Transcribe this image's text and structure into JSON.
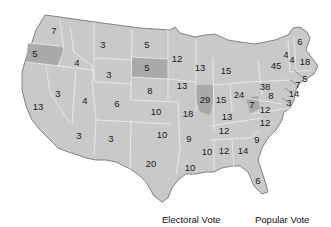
{
  "colors": {
    "land": "#c9c9c9",
    "land_dark": "#a9a9a9",
    "border": "#efefef",
    "coast": "#6a6a6a"
  },
  "legend": {
    "electoral_label": "Electoral Vote",
    "popular_label": "Popular Vote"
  },
  "states": [
    {
      "id": "WA",
      "votes": "7",
      "x": 54,
      "y": 31
    },
    {
      "id": "OR",
      "votes": "5",
      "x": 35,
      "y": 54,
      "dark": true
    },
    {
      "id": "CA",
      "votes": "13",
      "x": 38,
      "y": 107
    },
    {
      "id": "ID",
      "votes": "4",
      "x": 77,
      "y": 63
    },
    {
      "id": "NV",
      "votes": "3",
      "x": 58,
      "y": 94
    },
    {
      "id": "MT",
      "votes": "3",
      "x": 103,
      "y": 45
    },
    {
      "id": "WY",
      "votes": "3",
      "x": 109,
      "y": 75
    },
    {
      "id": "UT",
      "votes": "4",
      "x": 85,
      "y": 101
    },
    {
      "id": "AZ",
      "votes": "3",
      "x": 79,
      "y": 136
    },
    {
      "id": "CO",
      "votes": "6",
      "x": 117,
      "y": 104
    },
    {
      "id": "NM",
      "votes": "3",
      "x": 111,
      "y": 139
    },
    {
      "id": "ND",
      "votes": "5",
      "x": 147,
      "y": 45
    },
    {
      "id": "SD",
      "votes": "5",
      "x": 147,
      "y": 68,
      "dark": true
    },
    {
      "id": "NE",
      "votes": "8",
      "x": 150,
      "y": 91
    },
    {
      "id": "KS",
      "votes": "10",
      "x": 156,
      "y": 112
    },
    {
      "id": "OK",
      "votes": "10",
      "x": 162,
      "y": 135
    },
    {
      "id": "TX",
      "votes": "20",
      "x": 151,
      "y": 164
    },
    {
      "id": "MN",
      "votes": "12",
      "x": 177,
      "y": 59
    },
    {
      "id": "IA",
      "votes": "13",
      "x": 182,
      "y": 86
    },
    {
      "id": "MO",
      "votes": "18",
      "x": 188,
      "y": 114
    },
    {
      "id": "AR",
      "votes": "9",
      "x": 189,
      "y": 139
    },
    {
      "id": "LA",
      "votes": "10",
      "x": 190,
      "y": 168
    },
    {
      "id": "WI",
      "votes": "13",
      "x": 200,
      "y": 68
    },
    {
      "id": "IL",
      "votes": "29",
      "x": 205,
      "y": 100,
      "dark": true
    },
    {
      "id": "MI",
      "votes": "15",
      "x": 226,
      "y": 71
    },
    {
      "id": "IN",
      "votes": "15",
      "x": 221,
      "y": 100
    },
    {
      "id": "OH",
      "votes": "24",
      "x": 239,
      "y": 95
    },
    {
      "id": "KY",
      "votes": "13",
      "x": 227,
      "y": 117
    },
    {
      "id": "TN",
      "votes": "12",
      "x": 224,
      "y": 131
    },
    {
      "id": "MS",
      "votes": "10",
      "x": 207,
      "y": 152
    },
    {
      "id": "AL",
      "votes": "12",
      "x": 224,
      "y": 151
    },
    {
      "id": "GA",
      "votes": "14",
      "x": 243,
      "y": 151
    },
    {
      "id": "FL",
      "votes": "6",
      "x": 258,
      "y": 181
    },
    {
      "id": "SC",
      "votes": "9",
      "x": 257,
      "y": 140
    },
    {
      "id": "NC",
      "votes": "12",
      "x": 265,
      "y": 123
    },
    {
      "id": "VA",
      "votes": "12",
      "x": 265,
      "y": 110
    },
    {
      "id": "WV",
      "votes": "7",
      "x": 252,
      "y": 105,
      "dark": true
    },
    {
      "id": "PA",
      "votes": "38",
      "x": 265,
      "y": 87
    },
    {
      "id": "NY",
      "votes": "45",
      "x": 276,
      "y": 66
    },
    {
      "id": "VT",
      "votes": "4",
      "x": 286,
      "y": 55
    },
    {
      "id": "NH",
      "votes": "4",
      "x": 292,
      "y": 60
    },
    {
      "id": "ME",
      "votes": "6",
      "x": 300,
      "y": 42
    },
    {
      "id": "MA",
      "votes": "18",
      "x": 305,
      "y": 62
    },
    {
      "id": "RI",
      "votes": "5",
      "x": 305,
      "y": 79
    },
    {
      "id": "CT",
      "votes": "7",
      "x": 298,
      "y": 85
    },
    {
      "id": "NJ",
      "votes": "14",
      "x": 294,
      "y": 94
    },
    {
      "id": "MD",
      "votes": "8",
      "x": 271,
      "y": 96
    },
    {
      "id": "DE",
      "votes": "3",
      "x": 289,
      "y": 103
    }
  ]
}
